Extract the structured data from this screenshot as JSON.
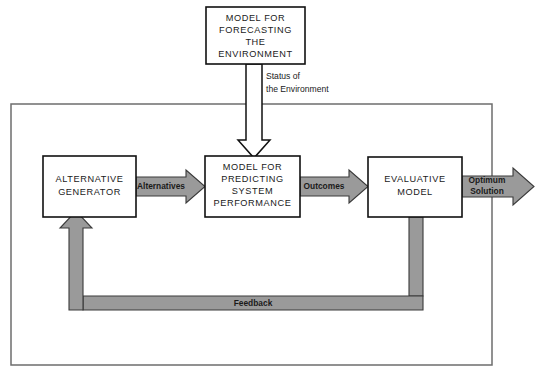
{
  "diagram": {
    "colors": {
      "arrow_fill": "#9a9a9a",
      "arrow_stroke": "#3a3a3a",
      "box_stroke": "#111111",
      "frame_stroke": "#6d6d6d",
      "background": "#ffffff",
      "text": "#1a1a1a"
    },
    "boxes": [
      {
        "id": "forecasting",
        "lines": [
          "MODEL FOR",
          "FORECASTING",
          "THE",
          "ENVIRONMENT"
        ]
      },
      {
        "id": "alternative-generator",
        "lines": [
          "ALTERNATIVE",
          "GENERATOR"
        ]
      },
      {
        "id": "predicting",
        "lines": [
          "MODEL FOR",
          "PREDICTING",
          "SYSTEM",
          "PERFORMANCE"
        ]
      },
      {
        "id": "evaluative",
        "lines": [
          "EVALUATIVE",
          "MODEL"
        ]
      }
    ],
    "flow_labels": {
      "alternatives": "Alternatives",
      "outcomes": "Outcomes",
      "optimum_solution_line1": "Optimum",
      "optimum_solution_line2": "Solution",
      "feedback": "Feedback"
    },
    "annotations": {
      "status_line1": "Status of",
      "status_line2": "the Environment"
    }
  }
}
